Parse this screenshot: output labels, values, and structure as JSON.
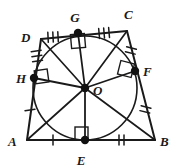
{
  "figure": {
    "type": "geometry-diagram",
    "stroke_color": "#1a1a1a",
    "fill_color": "#ffffff",
    "point_color": "#111111"
  },
  "labels": {
    "A": "A",
    "B": "B",
    "C": "C",
    "D": "D",
    "E": "E",
    "F": "F",
    "G": "G",
    "H": "H",
    "O": "O"
  },
  "points": [
    {
      "name": "A",
      "label": "A",
      "x": 27,
      "y": 140,
      "kind": "vertex",
      "dot": false,
      "label_x": 12,
      "label_y": 145
    },
    {
      "name": "B",
      "label": "B",
      "x": 155,
      "y": 140,
      "kind": "vertex",
      "dot": false,
      "label_x": 160,
      "label_y": 145
    },
    {
      "name": "C",
      "label": "C",
      "x": 127,
      "y": 31,
      "kind": "vertex",
      "dot": false,
      "label_x": 126,
      "label_y": 18
    },
    {
      "name": "D",
      "label": "D",
      "x": 41,
      "y": 39,
      "kind": "vertex",
      "dot": false,
      "label_x": 24,
      "label_y": 37
    },
    {
      "name": "E",
      "label": "E",
      "x": 85,
      "y": 140,
      "kind": "tangency",
      "dot": true,
      "label_x": 81,
      "label_y": 163
    },
    {
      "name": "F",
      "label": "F",
      "x": 135,
      "y": 71,
      "kind": "tangency",
      "dot": true,
      "label_x": 143,
      "label_y": 74
    },
    {
      "name": "G",
      "label": "G",
      "x": 78,
      "y": 33,
      "kind": "tangency",
      "dot": true,
      "label_x": 73,
      "label_y": 20
    },
    {
      "name": "H",
      "label": "H",
      "x": 34,
      "y": 78,
      "kind": "tangency",
      "dot": true,
      "label_x": 18,
      "label_y": 82
    },
    {
      "name": "O",
      "label": "O",
      "x": 85,
      "y": 88,
      "kind": "center",
      "dot": true,
      "label_x": 93,
      "label_y": 94
    }
  ],
  "circle": {
    "center_x": 85,
    "center_y": 88,
    "radius": 52
  },
  "sides": [
    {
      "name": "AB",
      "from": "A",
      "to": "B"
    },
    {
      "name": "BC",
      "from": "B",
      "to": "C"
    },
    {
      "name": "CD",
      "from": "C",
      "to": "D"
    },
    {
      "name": "DA",
      "from": "D",
      "to": "A"
    }
  ],
  "radii": [
    {
      "name": "OE",
      "from": "O",
      "to": "E",
      "right_angle": true
    },
    {
      "name": "OF",
      "from": "O",
      "to": "F",
      "right_angle": true
    },
    {
      "name": "OG",
      "from": "O",
      "to": "G",
      "right_angle": true
    },
    {
      "name": "OH",
      "from": "O",
      "to": "H",
      "right_angle": true
    }
  ],
  "cevians": [
    {
      "name": "OA",
      "from": "O",
      "to": "A"
    },
    {
      "name": "OB",
      "from": "O",
      "to": "B"
    },
    {
      "name": "OC",
      "from": "O",
      "to": "C"
    },
    {
      "name": "OD",
      "from": "O",
      "to": "D"
    }
  ],
  "tick_marks": [
    {
      "name": "AE",
      "segment": "A-E",
      "count": 1
    },
    {
      "name": "EB",
      "segment": "E-B",
      "count": 2
    },
    {
      "name": "BF",
      "segment": "B-F",
      "count": 2
    },
    {
      "name": "FC",
      "segment": "F-C",
      "count": 2
    },
    {
      "name": "CG",
      "segment": "C-G",
      "count": 3
    },
    {
      "name": "GD",
      "segment": "G-D",
      "count": 3
    },
    {
      "name": "DH",
      "segment": "D-H",
      "count": 3
    },
    {
      "name": "HA",
      "segment": "H-A",
      "count": 1
    }
  ],
  "right_angle_markers": [
    {
      "name": "angle-at-G",
      "at": "G"
    },
    {
      "name": "angle-at-F",
      "at": "F"
    },
    {
      "name": "angle-at-H",
      "at": "H"
    },
    {
      "name": "angle-at-E",
      "at": "E"
    }
  ]
}
